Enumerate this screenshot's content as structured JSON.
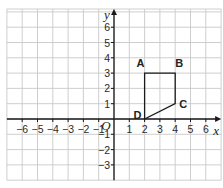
{
  "diagram": {
    "type": "coordinate-grid",
    "axes": {
      "x_label": "x",
      "y_label": "y",
      "origin_label": "O",
      "x_ticks": [
        -6,
        -5,
        -4,
        -3,
        -2,
        -1,
        1,
        2,
        3,
        4,
        5,
        6
      ],
      "y_ticks": [
        6,
        5,
        4,
        3,
        2,
        1,
        -1,
        -2,
        -3
      ],
      "x_range": [
        -7,
        7
      ],
      "y_range": [
        -4,
        7
      ],
      "grid": true
    },
    "shape": {
      "name": "ABCD",
      "vertices": [
        {
          "label": "A",
          "x": 2,
          "y": 3
        },
        {
          "label": "B",
          "x": 4,
          "y": 3
        },
        {
          "label": "C",
          "x": 4,
          "y": 1
        },
        {
          "label": "D",
          "x": 2,
          "y": 0
        }
      ]
    },
    "colors": {
      "grid": "#c8c8c8",
      "axis": "#1a1a1a",
      "shape": "#1a1a1a"
    }
  }
}
